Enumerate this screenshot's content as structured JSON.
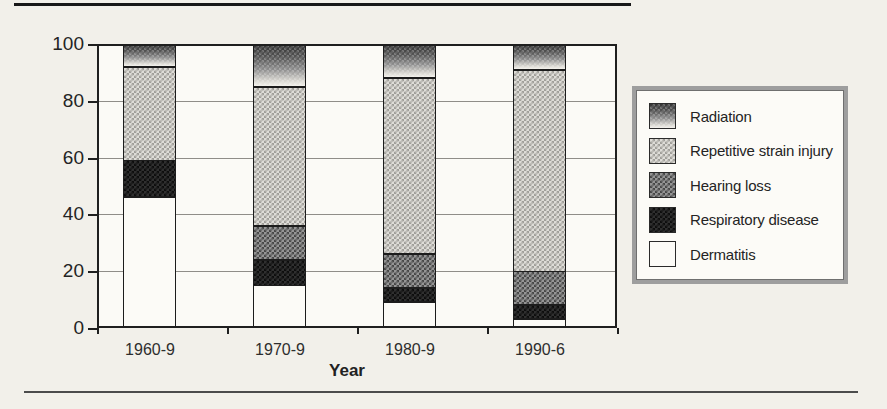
{
  "chart_data": {
    "type": "bar",
    "stacked": true,
    "title": "",
    "xlabel": "Year",
    "ylabel": "",
    "ylim": [
      0,
      100
    ],
    "yticks": [
      0,
      20,
      40,
      60,
      80,
      100
    ],
    "grid": true,
    "legend_position": "right",
    "categories": [
      "1960-9",
      "1970-9",
      "1980-9",
      "1990-6"
    ],
    "series": [
      {
        "name": "Dermatitis",
        "pattern": "dermatitis",
        "values": [
          46,
          15,
          9,
          3
        ]
      },
      {
        "name": "Respiratory disease",
        "pattern": "respiratory",
        "values": [
          13,
          9,
          5,
          5
        ]
      },
      {
        "name": "Hearing loss",
        "pattern": "hearing",
        "values": [
          0,
          12,
          12,
          12
        ]
      },
      {
        "name": "Repetitive strain injury",
        "pattern": "rsi",
        "values": [
          33,
          49,
          62,
          71
        ]
      },
      {
        "name": "Radiation",
        "pattern": "radiation",
        "values": [
          8,
          15,
          12,
          9
        ]
      }
    ],
    "legend_order_top_to_bottom": [
      "Radiation",
      "Repetitive strain injury",
      "Hearing loss",
      "Respiratory disease",
      "Dermatitis"
    ]
  },
  "colors": {
    "page_background": "#f2f0ea",
    "plot_background": "#fbfaf6",
    "axis_line": "#1f1f1f",
    "gridline": "#8f8d88",
    "legend_border": "#9e9e9e",
    "text": "#2b2b2b"
  }
}
